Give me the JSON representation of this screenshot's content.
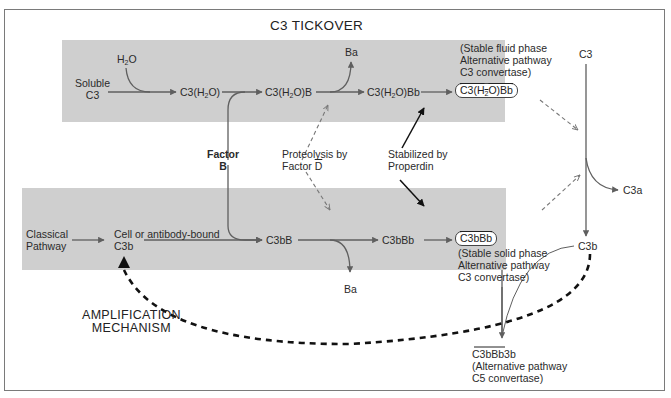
{
  "diagram": {
    "title_top": "C3 TICKOVER",
    "title_bottom": [
      "AMPLIFICATION",
      "MECHANISM"
    ],
    "colors": {
      "panel": "#cfcfcf",
      "arrow_gray": "#5f5f5f",
      "arrow_black": "#111111",
      "frame": "#7a7a7a"
    },
    "top_row": {
      "water": "H2O",
      "soluble_c3": [
        "Soluble",
        "C3"
      ],
      "c3h2o": "C3(H2O)",
      "c3h2ob": "C3(H2O)B",
      "ba": "Ba",
      "c3h2obb": "C3(H2O)Bb",
      "convertase_box": "C3(H2O)Bb",
      "convertase_note": [
        "(Stable fluid phase",
        "Alternative pathway",
        "C3 convertase)"
      ]
    },
    "middle": {
      "factor_b": [
        "Factor",
        "B"
      ],
      "proteolysis": [
        "Proteolysis by",
        "Factor D"
      ],
      "properdin": [
        "Stabilized by",
        "Properdin"
      ]
    },
    "bottom_row": {
      "classical": [
        "Classical",
        "Pathway"
      ],
      "cell_bound": [
        "Cell or antibody-bound",
        "C3b"
      ],
      "c3bb": "C3bB",
      "c3bbb": "C3bBb",
      "ba": "Ba",
      "convertase_box": "C3bBb",
      "convertase_note": [
        "(Stable solid phase",
        "Alternative pathway",
        "C3 convertase)"
      ]
    },
    "right_column": {
      "c3": "C3",
      "c3a": "C3a",
      "c3b": "C3b"
    },
    "c5_convertase": {
      "name": "C3bBb3b",
      "note": [
        "(Alternative pathway",
        "C5 convertase)"
      ]
    }
  }
}
